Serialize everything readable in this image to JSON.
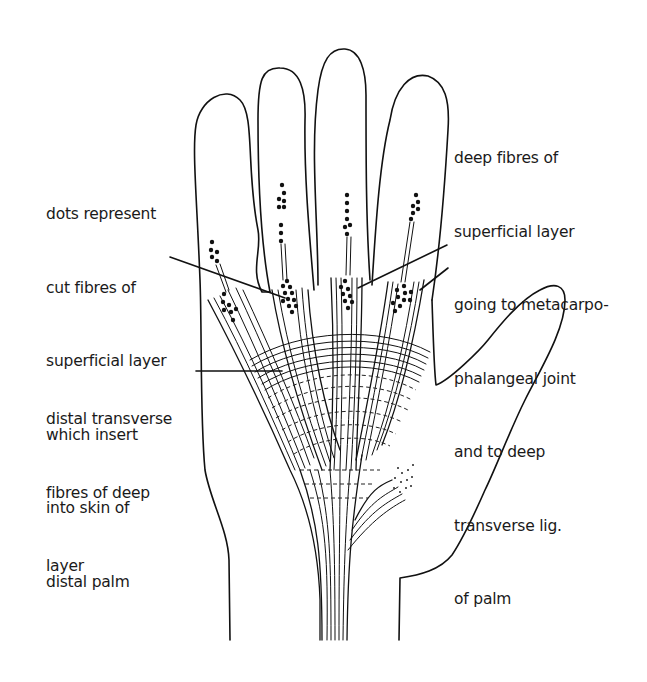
{
  "figure": {
    "labels": [
      {
        "id": "dots-label",
        "lines": [
          "dots represent",
          "cut fibres of",
          "superficial layer",
          "which insert",
          "into skin of",
          "distal palm"
        ]
      },
      {
        "id": "deep-fibres-label",
        "lines": [
          "deep fibres of",
          "superficial layer",
          "going to metacarpo-",
          "phalangeal joint",
          "and to deep",
          "transverse lig.",
          "of palm"
        ]
      },
      {
        "id": "distal-transverse-label",
        "lines": [
          "distal transverse",
          "fibres of deep",
          "layer"
        ]
      }
    ]
  }
}
